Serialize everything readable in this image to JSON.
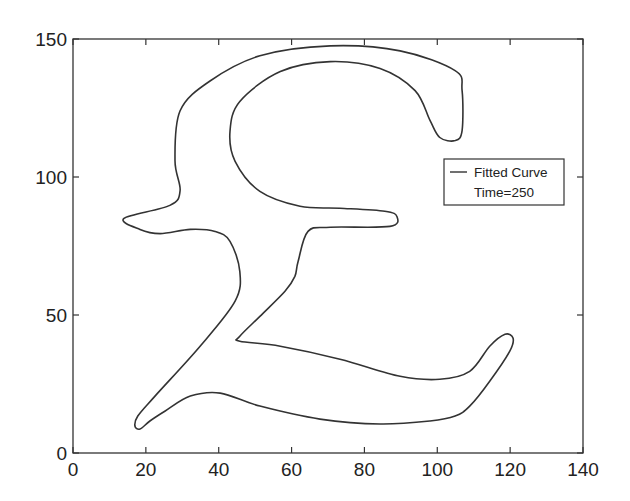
{
  "chart_data": {
    "type": "line",
    "title": "",
    "xlabel": "",
    "ylabel": "",
    "xlim": [
      0,
      140
    ],
    "ylim": [
      0,
      150
    ],
    "x_ticks": [
      0,
      20,
      40,
      60,
      80,
      100,
      120,
      140
    ],
    "y_ticks": [
      0,
      50,
      100,
      150
    ],
    "grid": false,
    "legend_position": "right-middle inside",
    "legend": [
      "Fitted Curve",
      "Time=250"
    ],
    "line_color": "#333333",
    "series": [
      {
        "name": "Fitted Curve",
        "closed": true,
        "points": [
          [
            14.0,
            85.0
          ],
          [
            26.6,
            89.7
          ],
          [
            29.4,
            95.1
          ],
          [
            28.0,
            105.9
          ],
          [
            29.4,
            124.0
          ],
          [
            37.6,
            134.8
          ],
          [
            51.3,
            143.9
          ],
          [
            70.6,
            147.5
          ],
          [
            89.8,
            145.7
          ],
          [
            104.9,
            138.5
          ],
          [
            106.8,
            131.3
          ],
          [
            106.8,
            116.8
          ],
          [
            104.9,
            113.2
          ],
          [
            100.7,
            114.3
          ],
          [
            98.0,
            120.5
          ],
          [
            93.9,
            131.3
          ],
          [
            84.3,
            139.3
          ],
          [
            70.6,
            141.8
          ],
          [
            56.9,
            138.2
          ],
          [
            45.8,
            127.4
          ],
          [
            43.1,
            116.6
          ],
          [
            44.5,
            105.7
          ],
          [
            51.3,
            94.8
          ],
          [
            62.3,
            89.4
          ],
          [
            73.3,
            88.7
          ],
          [
            85.6,
            87.6
          ],
          [
            88.9,
            85.7
          ],
          [
            87.0,
            82.1
          ],
          [
            70.6,
            81.8
          ],
          [
            64.5,
            80.3
          ],
          [
            61.8,
            69.4
          ],
          [
            60.9,
            64.0
          ],
          [
            58.2,
            58.6
          ],
          [
            51.3,
            49.5
          ],
          [
            45.8,
            42.3
          ],
          [
            45.8,
            40.5
          ],
          [
            56.9,
            38.7
          ],
          [
            73.3,
            34.0
          ],
          [
            89.8,
            27.8
          ],
          [
            100.7,
            26.7
          ],
          [
            108.9,
            29.6
          ],
          [
            114.4,
            38.7
          ],
          [
            118.6,
            43.0
          ],
          [
            120.8,
            41.6
          ],
          [
            119.9,
            36.9
          ],
          [
            114.4,
            26.0
          ],
          [
            108.9,
            17.0
          ],
          [
            104.9,
            13.4
          ],
          [
            98.0,
            11.6
          ],
          [
            84.3,
            10.5
          ],
          [
            67.8,
            12.3
          ],
          [
            51.3,
            17.0
          ],
          [
            40.4,
            21.7
          ],
          [
            32.2,
            20.6
          ],
          [
            25.3,
            15.2
          ],
          [
            21.1,
            11.6
          ],
          [
            18.4,
            8.7
          ],
          [
            17.0,
            9.8
          ],
          [
            17.8,
            13.4
          ],
          [
            22.5,
            20.6
          ],
          [
            34.9,
            38.7
          ],
          [
            44.5,
            55.0
          ],
          [
            45.8,
            65.8
          ],
          [
            43.1,
            76.7
          ],
          [
            39.0,
            80.3
          ],
          [
            32.2,
            81.0
          ],
          [
            23.9,
            79.5
          ],
          [
            18.4,
            81.0
          ],
          [
            14.0,
            85.0
          ]
        ]
      }
    ]
  },
  "legend": {
    "line_label": "Fitted Curve",
    "time_label": "Time=250"
  },
  "axes": {
    "x_tick_labels": [
      "0",
      "20",
      "40",
      "60",
      "80",
      "100",
      "120",
      "140"
    ],
    "y_tick_labels": [
      "0",
      "50",
      "100",
      "150"
    ]
  }
}
